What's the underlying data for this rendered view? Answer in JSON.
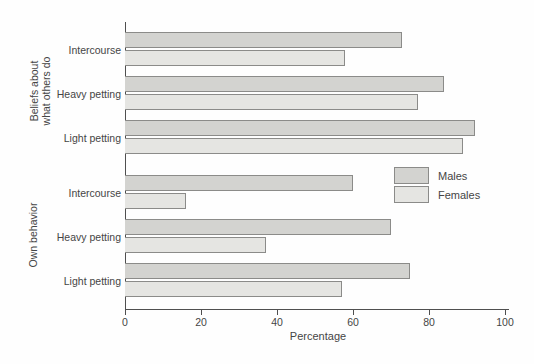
{
  "colors": {
    "bg": "#fefefe",
    "males": "#d3d3d0",
    "females": "#e5e5e2",
    "bar_border": "#8b8b89",
    "axis": "#4f4f4f",
    "text": "#454545"
  },
  "chart_data": {
    "type": "bar",
    "orientation": "horizontal",
    "xlabel": "Percentage",
    "xlim": [
      0,
      100
    ],
    "xticks": [
      0,
      20,
      40,
      60,
      80,
      100
    ],
    "grid": false,
    "legend": {
      "position": "middle-right",
      "entries": [
        {
          "name": "Males",
          "color": "#d3d3d0"
        },
        {
          "name": "Females",
          "color": "#e5e5e2"
        }
      ]
    },
    "groups": [
      {
        "label": "Beliefs about what others do",
        "label_lines": {
          "line1": "Beliefs about",
          "line2": "what others do"
        },
        "categories": [
          "Intercourse",
          "Heavy petting",
          "Light petting"
        ],
        "series": [
          {
            "name": "Males",
            "values": [
              73,
              84,
              92
            ]
          },
          {
            "name": "Females",
            "values": [
              58,
              77,
              89
            ]
          }
        ]
      },
      {
        "label": "Own behavior",
        "label_lines": {
          "line1": "Own behavior",
          "line2": ""
        },
        "categories": [
          "Intercourse",
          "Heavy petting",
          "Light petting"
        ],
        "series": [
          {
            "name": "Males",
            "values": [
              60,
              70,
              75
            ]
          },
          {
            "name": "Females",
            "values": [
              16,
              37,
              57
            ]
          }
        ]
      }
    ]
  }
}
